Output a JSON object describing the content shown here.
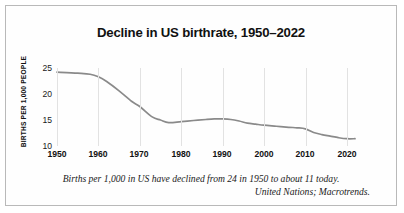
{
  "chart_data": {
    "type": "line",
    "title": "Decline in US birthrate, 1950–2022",
    "xlabel": "",
    "ylabel": "BIRTHS PER 1,000 PEOPLE",
    "xlim": [
      1950,
      2022
    ],
    "ylim": [
      10,
      25
    ],
    "grid": "vertical",
    "legend": "none",
    "xticks": [
      "1950",
      "1960",
      "1970",
      "1980",
      "1990",
      "2000",
      "2010",
      "2020"
    ],
    "yticks": [
      "25",
      "20",
      "15",
      "10"
    ],
    "line_color": "#8a8a8a",
    "series": [
      {
        "name": "US birthrate",
        "x": [
          1950,
          1955,
          1958,
          1960,
          1962,
          1965,
          1968,
          1970,
          1973,
          1975,
          1977,
          1980,
          1983,
          1986,
          1988,
          1990,
          1992,
          1994,
          1996,
          1998,
          2000,
          2003,
          2006,
          2008,
          2010,
          2012,
          2014,
          2016,
          2018,
          2020,
          2022
        ],
        "values": [
          24.2,
          24.0,
          23.8,
          23.3,
          22.4,
          20.6,
          18.6,
          17.6,
          15.6,
          15.0,
          14.5,
          14.7,
          14.9,
          15.1,
          15.2,
          15.2,
          15.1,
          14.8,
          14.4,
          14.2,
          14.0,
          13.8,
          13.6,
          13.5,
          13.3,
          12.6,
          12.2,
          11.9,
          11.6,
          11.4,
          11.4
        ]
      }
    ],
    "caption_line1": "Births per 1,000 in US have declined from 24 in 1950 to about 11 today.",
    "caption_line2": "United Nations; Macrotrends."
  }
}
